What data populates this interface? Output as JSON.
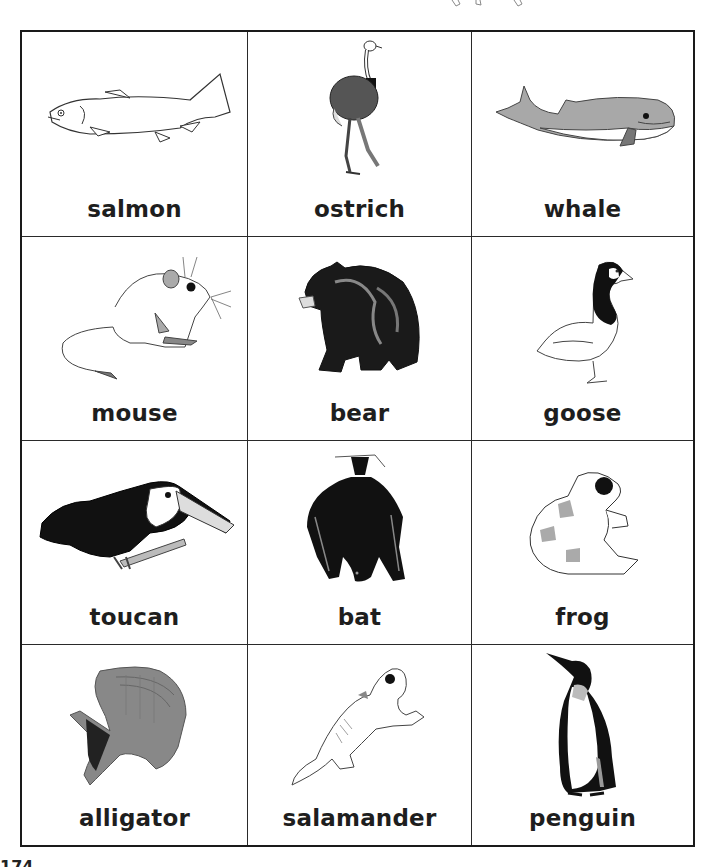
{
  "worksheet": {
    "page_number": "174",
    "cards": [
      {
        "label": "salmon",
        "icon": "salmon-icon"
      },
      {
        "label": "ostrich",
        "icon": "ostrich-icon"
      },
      {
        "label": "whale",
        "icon": "whale-icon"
      },
      {
        "label": "mouse",
        "icon": "mouse-icon"
      },
      {
        "label": "bear",
        "icon": "bear-icon"
      },
      {
        "label": "goose",
        "icon": "goose-icon"
      },
      {
        "label": "toucan",
        "icon": "toucan-icon"
      },
      {
        "label": "bat",
        "icon": "bat-icon"
      },
      {
        "label": "frog",
        "icon": "frog-icon"
      },
      {
        "label": "alligator",
        "icon": "alligator-icon"
      },
      {
        "label": "salamander",
        "icon": "salamander-icon"
      },
      {
        "label": "penguin",
        "icon": "penguin-icon"
      }
    ]
  },
  "colors": {
    "border": "#1a1a1a",
    "label": "#1e1e1e",
    "gray_fill": "#a8a8a8",
    "dark_fill": "#111111"
  }
}
